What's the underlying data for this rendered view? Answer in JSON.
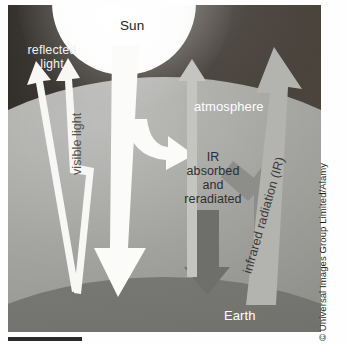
{
  "figure": {
    "labels": {
      "sun": "Sun",
      "reflected_light": "reflected\nlight",
      "visible_light": "visible light",
      "atmosphere": "atmosphere",
      "ir_absorbed": "IR\nabsorbed\nand\nreradiated",
      "infrared_radiation": "infrared radiation (IR)",
      "earth": "Earth"
    },
    "arrows": [
      {
        "name": "reflected-light-arrow-left",
        "direction": "up",
        "color": "#ffffff",
        "meaning": "reflected light escaping to space"
      },
      {
        "name": "reflected-light-arrow-right",
        "direction": "up",
        "color": "#ffffff",
        "meaning": "reflected light escaping to space"
      },
      {
        "name": "visible-light-arrow",
        "direction": "down",
        "color": "#ffffff",
        "meaning": "incoming visible light from Sun to Earth"
      },
      {
        "name": "visible-light-branch-arrow",
        "direction": "down-right",
        "color": "#ffffff",
        "meaning": "visible light absorbed in atmosphere"
      },
      {
        "name": "ir-reradiated-down-arrow",
        "direction": "down",
        "color": "#6f6f6b",
        "meaning": "IR reradiated back down to Earth"
      },
      {
        "name": "ir-upward-from-earth-arrow",
        "direction": "up-left",
        "color": "#8e8e8a",
        "meaning": "IR rising from Earth into atmosphere"
      },
      {
        "name": "atmosphere-escape-arrow",
        "direction": "up",
        "color": "#c9c9c5",
        "meaning": "IR escaping atmosphere"
      },
      {
        "name": "infrared-radiation-arrow",
        "direction": "up",
        "color": "#b4b4b0",
        "meaning": "infrared radiation leaving Earth"
      }
    ],
    "colors": {
      "space": "#3b3733",
      "atmosphere": "#8d8d8a",
      "earth": "#6f6f6b",
      "sun": "#ffffff",
      "arrow_light": "#ffffff",
      "arrow_dark": "#6f6f6b"
    }
  },
  "credit": {
    "text": "© Universal Images Group Limited/Alamy"
  }
}
